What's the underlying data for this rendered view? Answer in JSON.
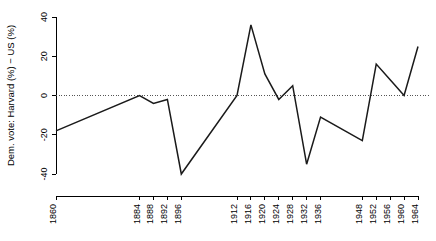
{
  "chart_data": {
    "type": "line",
    "title": "",
    "subtitle": "",
    "xlabel": "",
    "ylabel": "Dem. vote: Harvard (%) − US (%)",
    "xlim": [
      1860,
      1964
    ],
    "ylim": [
      -40,
      40
    ],
    "grid": false,
    "legend": null,
    "legend_position": "none",
    "zero_reference_line": true,
    "x_tick_labels": [
      "1860",
      "1884",
      "1888",
      "1892",
      "1896",
      "1912",
      "1916",
      "1920",
      "1924",
      "1928",
      "1932",
      "1936",
      "1948",
      "1952",
      "1956",
      "1960",
      "1964"
    ],
    "y_tick_labels": [
      "-40",
      "-20",
      "0",
      "20",
      "40"
    ],
    "y_ticks": [
      -40,
      -20,
      0,
      20,
      40
    ],
    "x": [
      1860,
      1884,
      1888,
      1892,
      1896,
      1912,
      1916,
      1920,
      1924,
      1928,
      1932,
      1936,
      1948,
      1952,
      1956,
      1960,
      1964
    ],
    "values": [
      -18,
      0,
      -4,
      -2,
      -40,
      0,
      36,
      11,
      -2,
      5,
      -35,
      -11,
      -23,
      16,
      8,
      0,
      25
    ],
    "series": [
      {
        "name": "Dem. vote difference",
        "color": "#1a1a1a",
        "values": [
          -18,
          0,
          -4,
          -2,
          -40,
          0,
          36,
          11,
          -2,
          5,
          -35,
          -11,
          -23,
          16,
          8,
          0,
          25
        ]
      }
    ],
    "points": [
      {
        "x": 1860,
        "y": -18
      },
      {
        "x": 1884,
        "y": 0
      },
      {
        "x": 1888,
        "y": -4
      },
      {
        "x": 1892,
        "y": -2
      },
      {
        "x": 1896,
        "y": -40
      },
      {
        "x": 1912,
        "y": 0
      },
      {
        "x": 1916,
        "y": 36
      },
      {
        "x": 1920,
        "y": 11
      },
      {
        "x": 1924,
        "y": -2
      },
      {
        "x": 1928,
        "y": 5
      },
      {
        "x": 1932,
        "y": -35
      },
      {
        "x": 1936,
        "y": -11
      },
      {
        "x": 1948,
        "y": -23
      },
      {
        "x": 1952,
        "y": 16
      },
      {
        "x": 1956,
        "y": 8
      },
      {
        "x": 1960,
        "y": 0
      },
      {
        "x": 1964,
        "y": 25
      }
    ]
  }
}
